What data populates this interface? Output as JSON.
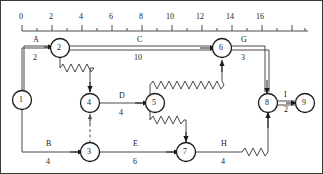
{
  "diagram": {
    "type": "pert-cpm-network",
    "axis": {
      "name": "time-scale-axis",
      "ticks": [
        "0",
        "2",
        "4",
        "6",
        "8",
        "10",
        "12",
        "14",
        "16"
      ],
      "tick_values": [
        0,
        2,
        4,
        6,
        8,
        10,
        12,
        14,
        16
      ],
      "minor_tick_step": 1,
      "units_per_pixel": 15,
      "origin_x": 22
    },
    "nodes": [
      {
        "id": "1",
        "label": "1",
        "x": 22,
        "y": 100
      },
      {
        "id": "2",
        "label": "2",
        "x": 60,
        "y": 48
      },
      {
        "id": "3",
        "label": "3",
        "x": 90,
        "y": 152
      },
      {
        "id": "4",
        "label": "4",
        "x": 90,
        "y": 103
      },
      {
        "id": "5",
        "label": "5",
        "x": 155,
        "y": 103
      },
      {
        "id": "6",
        "label": "6",
        "x": 222,
        "y": 48
      },
      {
        "id": "7",
        "label": "7",
        "x": 186,
        "y": 152
      },
      {
        "id": "8",
        "label": "8",
        "x": 268,
        "y": 103
      },
      {
        "id": "9",
        "label": "9",
        "x": 305,
        "y": 103
      }
    ],
    "activities": [
      {
        "id": "A",
        "label": "A",
        "duration": "2",
        "from": "1",
        "to": "2",
        "critical": true
      },
      {
        "id": "B",
        "label": "B",
        "duration": "4",
        "from": "1",
        "to": "3",
        "critical": false
      },
      {
        "id": "C",
        "label": "C",
        "duration": "10",
        "from": "2",
        "to": "6",
        "critical": true
      },
      {
        "id": "D",
        "label": "D",
        "duration": "4",
        "from": "4",
        "to": "5",
        "critical": false
      },
      {
        "id": "E",
        "label": "E",
        "duration": "6",
        "from": "3",
        "to": "7",
        "critical": false
      },
      {
        "id": "G",
        "label": "G",
        "duration": "3",
        "from": "6",
        "to": "8",
        "critical": true
      },
      {
        "id": "H",
        "label": "H",
        "duration": "4",
        "from": "7",
        "to": "8",
        "critical": false
      },
      {
        "id": "I",
        "label": "I",
        "duration": "2",
        "from": "8",
        "to": "9",
        "critical": true
      }
    ],
    "dummy_links": [
      {
        "from": "3",
        "to": "4",
        "style": "dashed"
      }
    ],
    "float_links": [
      {
        "from": "2",
        "to": "4",
        "style": "zigzag"
      },
      {
        "from": "5",
        "to": "6",
        "style": "zigzag"
      },
      {
        "from": "5",
        "to": "7",
        "style": "zigzag"
      },
      {
        "from": "7",
        "to": "8",
        "style": "zigzag"
      }
    ],
    "colors": {
      "line": "#4a4a4a",
      "critical": "#8a8a8a",
      "node_stroke": "#1a1a1a",
      "text": "#1a1a1a",
      "frame": "#3a3a3a"
    }
  }
}
